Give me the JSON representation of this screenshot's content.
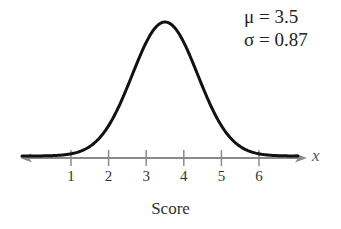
{
  "chart_data": {
    "type": "line",
    "title": "",
    "subtitle": "Normal distribution curve",
    "xlabel": "Score",
    "ylabel": "",
    "axis_variable": "x",
    "x_ticks": [
      "1",
      "2",
      "3",
      "4",
      "5",
      "6"
    ],
    "x_tick_values": [
      1,
      2,
      3,
      4,
      5,
      6
    ],
    "xlim": [
      -0.3,
      7.2
    ],
    "annotations": [
      {
        "symbol": "μ",
        "text": "μ = 3.5",
        "value": 3.5
      },
      {
        "symbol": "σ",
        "text": "σ = 0.87",
        "value": 0.87
      }
    ],
    "series": [
      {
        "name": "normal curve",
        "distribution": "normal",
        "mean": 3.5,
        "std": 0.87
      }
    ],
    "grid": false,
    "legend": "none"
  },
  "labels": {
    "mu": "μ = 3.5",
    "sigma": "σ = 0.87",
    "xlabel": "Score",
    "axis_var": "x",
    "ticks": [
      "1",
      "2",
      "3",
      "4",
      "5",
      "6"
    ]
  },
  "colors": {
    "curve": "#111111",
    "axis": "#8a8a8a",
    "text": "#333333"
  }
}
